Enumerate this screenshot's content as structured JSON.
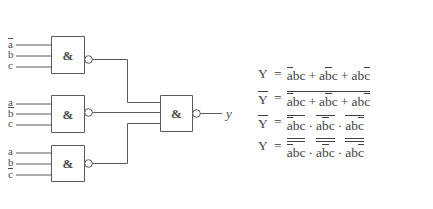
{
  "diagram": {
    "stroke_color": "#5a5a5a",
    "text_color": "#4a4a4a",
    "background": "#ffffff",
    "gate_symbol": "&",
    "gates": [
      {
        "name": "nand-gate-1",
        "symbol": "&",
        "inputs": [
          "ā",
          "b",
          "c"
        ]
      },
      {
        "name": "nand-gate-2",
        "symbol": "&",
        "inputs": [
          "a",
          "b̄",
          "c"
        ]
      },
      {
        "name": "nand-gate-3",
        "symbol": "&",
        "inputs": [
          "a",
          "b",
          "c̄"
        ]
      },
      {
        "name": "nand-gate-output",
        "symbol": "&",
        "inputs": [
          "g1",
          "g2",
          "g3"
        ]
      }
    ],
    "inputs_g1": [
      {
        "letter": "a",
        "bar": true
      },
      {
        "letter": "b",
        "bar": false
      },
      {
        "letter": "c",
        "bar": false
      }
    ],
    "inputs_g2": [
      {
        "letter": "a",
        "bar": false
      },
      {
        "letter": "b",
        "bar": true
      },
      {
        "letter": "c",
        "bar": false
      }
    ],
    "inputs_g3": [
      {
        "letter": "a",
        "bar": false
      },
      {
        "letter": "b",
        "bar": false
      },
      {
        "letter": "c",
        "bar": true
      }
    ],
    "output_label": "y"
  },
  "equations": [
    {
      "id": "eq-1",
      "lhs": "Y",
      "lhs_bar": false,
      "eq": "=",
      "plain": "Y = ābc + ab̄c + abc̄",
      "terms": [
        {
          "letters": [
            {
              "ch": "a",
              "bar": true
            },
            {
              "ch": "b",
              "bar": false
            },
            {
              "ch": "c",
              "bar": false
            }
          ]
        },
        {
          "letters": [
            {
              "ch": "a",
              "bar": false
            },
            {
              "ch": "b",
              "bar": true
            },
            {
              "ch": "c",
              "bar": false
            }
          ]
        },
        {
          "letters": [
            {
              "ch": "a",
              "bar": false
            },
            {
              "ch": "b",
              "bar": false
            },
            {
              "ch": "c",
              "bar": true
            }
          ]
        }
      ],
      "operator": "+",
      "whole_bar": 0,
      "term_bar": 0
    },
    {
      "id": "eq-2",
      "lhs": "Y",
      "lhs_bar": true,
      "eq": "=",
      "plain": "Ȳ = (ābc + ab̄c + abc̄)̅",
      "terms": [
        {
          "letters": [
            {
              "ch": "a",
              "bar": true
            },
            {
              "ch": "b",
              "bar": false
            },
            {
              "ch": "c",
              "bar": false
            }
          ]
        },
        {
          "letters": [
            {
              "ch": "a",
              "bar": false
            },
            {
              "ch": "b",
              "bar": true
            },
            {
              "ch": "c",
              "bar": false
            }
          ]
        },
        {
          "letters": [
            {
              "ch": "a",
              "bar": false
            },
            {
              "ch": "b",
              "bar": false
            },
            {
              "ch": "c",
              "bar": true
            }
          ]
        }
      ],
      "operator": "+",
      "whole_bar": 1,
      "term_bar": 0
    },
    {
      "id": "eq-3",
      "lhs": "Y",
      "lhs_bar": true,
      "eq": "=",
      "plain": "Ȳ = (ābc)̅ · (ab̄c)̅ · (abc̄)̅",
      "terms": [
        {
          "letters": [
            {
              "ch": "a",
              "bar": true
            },
            {
              "ch": "b",
              "bar": false
            },
            {
              "ch": "c",
              "bar": false
            }
          ]
        },
        {
          "letters": [
            {
              "ch": "a",
              "bar": false
            },
            {
              "ch": "b",
              "bar": true
            },
            {
              "ch": "c",
              "bar": false
            }
          ]
        },
        {
          "letters": [
            {
              "ch": "a",
              "bar": false
            },
            {
              "ch": "b",
              "bar": false
            },
            {
              "ch": "c",
              "bar": true
            }
          ]
        }
      ],
      "operator": "·",
      "whole_bar": 0,
      "term_bar": 1
    },
    {
      "id": "eq-4",
      "lhs": "Y",
      "lhs_bar": false,
      "eq": "=",
      "plain": "Y = (ābc)̅̅ · (ab̄c)̅̅ · (abc̄)̅̅",
      "terms": [
        {
          "letters": [
            {
              "ch": "a",
              "bar": true
            },
            {
              "ch": "b",
              "bar": false
            },
            {
              "ch": "c",
              "bar": false
            }
          ]
        },
        {
          "letters": [
            {
              "ch": "a",
              "bar": false
            },
            {
              "ch": "b",
              "bar": true
            },
            {
              "ch": "c",
              "bar": false
            }
          ]
        },
        {
          "letters": [
            {
              "ch": "a",
              "bar": false
            },
            {
              "ch": "b",
              "bar": false
            },
            {
              "ch": "c",
              "bar": true
            }
          ]
        }
      ],
      "operator": "·",
      "whole_bar": 0,
      "term_bar": 2
    }
  ]
}
